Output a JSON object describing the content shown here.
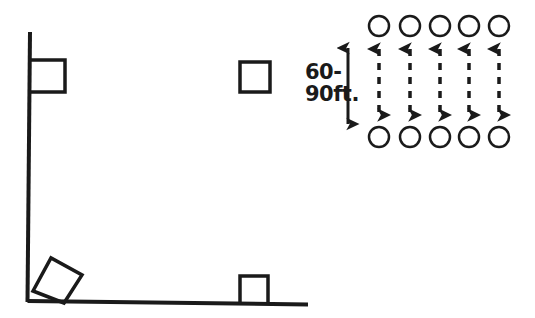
{
  "canvas": {
    "width": 535,
    "height": 318,
    "background": "#ffffff",
    "ink": "#1a1a1a"
  },
  "diagram": {
    "left_figure": {
      "name": "corner-structure",
      "description": "Vertical line meeting a horizontal ground line at a right-angle corner, with attached square markers",
      "vertical_line": {
        "x1": 30,
        "y1": 32,
        "x2": 27,
        "y2": 302,
        "stroke_width": 4
      },
      "horizontal_line": {
        "x1": 27,
        "y1": 301,
        "x2": 308,
        "y2": 304,
        "stroke_width": 4
      },
      "squares": [
        {
          "id": "square-top-left",
          "x": 35,
          "y": 60,
          "size": 32,
          "attached_to": "vertical-line",
          "open_side": "left"
        },
        {
          "id": "square-floating",
          "x": 240,
          "y": 62,
          "size": 30,
          "attached_to": "none",
          "open_side": "none"
        },
        {
          "id": "square-bottom-right",
          "x": 240,
          "y": 275,
          "size": 28,
          "attached_to": "horizontal-line",
          "open_side": "bottom"
        }
      ],
      "corner_diamond": {
        "id": "corner-angle-marker",
        "points": "33,290 50,258 80,274 63,303",
        "description": "rotated square marking the right angle at the corner"
      }
    },
    "right_figure": {
      "name": "node-spacing-grid",
      "columns": 5,
      "rows": 2,
      "circle_radius": 10,
      "circle_stroke_width": 2.5,
      "top_row_y": 26,
      "bottom_row_y": 137,
      "column_x": [
        379,
        410,
        440,
        469,
        499
      ],
      "connectors": {
        "style": "dashed",
        "double_headed": true,
        "dash_pattern": "7 7",
        "stroke_width": 3.5,
        "arrowhead": "solid-filled-triangle"
      }
    },
    "dimension": {
      "name": "spacing-dimension",
      "label_line_1": "60-",
      "label_line_2": "90ft.",
      "label_full": "60-90ft.",
      "arrow": {
        "x": 348,
        "y_top": 42,
        "y_bottom": 128,
        "style": "solid",
        "double_headed": true,
        "stroke_width": 3
      },
      "label_x": 305,
      "label_y_1": 78,
      "label_y_2": 100
    }
  }
}
